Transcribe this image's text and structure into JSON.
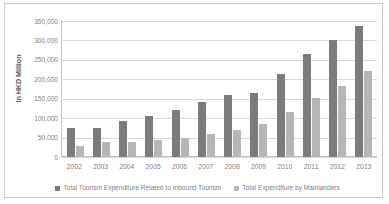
{
  "chart_data": {
    "type": "bar",
    "title": "",
    "xlabel": "",
    "ylabel": "in HKD Million",
    "ylim": [
      0,
      350000
    ],
    "ytick_step": 50000,
    "ytick_labels": [
      "350,000",
      "300,000",
      "250,000",
      "200,000",
      "150,000",
      "100,000",
      "50,000",
      "0"
    ],
    "ytick_values": [
      350000,
      300000,
      250000,
      200000,
      150000,
      100000,
      50000,
      0
    ],
    "grid": true,
    "legend_position": "bottom",
    "categories": [
      "2002",
      "2003",
      "2004",
      "2005",
      "2006",
      "2007",
      "2008",
      "2009",
      "2010",
      "2011",
      "2012",
      "2013"
    ],
    "series": [
      {
        "name": "Total Tourism Expenditure Related to Inbound Tourism",
        "color": "#7b7b7b",
        "values": [
          75000,
          74000,
          92000,
          106000,
          120000,
          142000,
          160000,
          164000,
          214000,
          266000,
          301000,
          337000
        ]
      },
      {
        "name": "Total Expenditure by Mainlanders",
        "color": "#b6b6b6",
        "values": [
          29000,
          38000,
          39000,
          43000,
          48000,
          59000,
          70000,
          85000,
          116000,
          151000,
          182000,
          222000
        ]
      }
    ]
  },
  "colors": {
    "series_a": "#7b7b7b",
    "series_b": "#b6b6b6",
    "gridline": "#d9d9d9",
    "axis": "#bfbfbf",
    "text": "#7f7f7f",
    "frame": "#c8c8c8"
  }
}
